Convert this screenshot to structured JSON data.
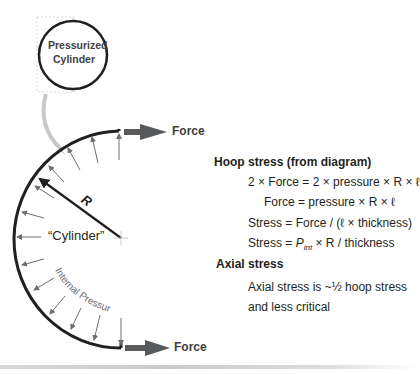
{
  "diagram": {
    "inset_label_line1": "Pressurized",
    "inset_label_line2": "Cylinder",
    "force_top_label": "Force",
    "force_bottom_label": "Force",
    "radius_label": "R",
    "cylinder_label": "“Cylinder”",
    "pressure_label": "Internal Pressure",
    "colors": {
      "wall": "#231f20",
      "force_arrow": "#58595b",
      "pressure_arrow": "#6d6e71",
      "leader_curve": "#c7c8ca"
    }
  },
  "notes": {
    "hoop_heading": "Hoop stress (from diagram)",
    "hoop_eq1": "2 × Force = 2 × pressure × R × ℓ",
    "hoop_eq2": "Force = pressure × R × ℓ",
    "hoop_eq3": "Stress = Force / (ℓ × thickness)",
    "hoop_eq4_prefix": "Stress = ",
    "hoop_eq4_p": "P",
    "hoop_eq4_sub": "int",
    "hoop_eq4_suffix": " × R / thickness",
    "axial_heading": "Axial stress",
    "axial_line1": "Axial stress is ~½ hoop stress",
    "axial_line2": "and less critical"
  }
}
